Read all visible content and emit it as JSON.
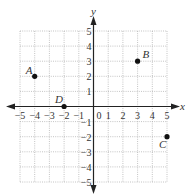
{
  "chart_data": {
    "type": "scatter",
    "title": "",
    "xlabel": "x",
    "ylabel": "y",
    "xlim": [
      -5,
      5
    ],
    "ylim": [
      -5,
      5
    ],
    "grid": true,
    "x_ticks": [
      -5,
      -4,
      -3,
      -2,
      -1,
      0,
      1,
      2,
      3,
      4,
      5
    ],
    "y_ticks": [
      -5,
      -4,
      -3,
      -2,
      -1,
      1,
      2,
      3,
      4,
      5
    ],
    "points": [
      {
        "label": "A",
        "x": -4,
        "y": 2
      },
      {
        "label": "B",
        "x": 3,
        "y": 3
      },
      {
        "label": "C",
        "x": 5,
        "y": -2
      },
      {
        "label": "D",
        "x": -2,
        "y": 0
      }
    ]
  },
  "axes": {
    "x_label": "x",
    "y_label": "y",
    "origin_label": "0"
  }
}
